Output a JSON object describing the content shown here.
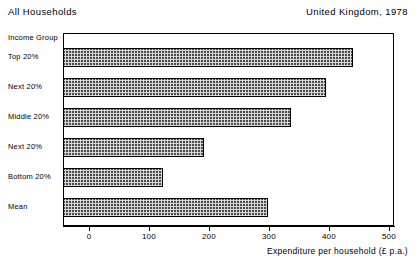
{
  "header": {
    "title": "All Households",
    "subtitle": "United Kingdom, 1978"
  },
  "chart_data": {
    "type": "bar",
    "orientation": "horizontal",
    "title": "All Households",
    "subtitle": "United Kingdom, 1978",
    "category_axis_title": "Income Group",
    "categories": [
      "Top 20%",
      "Next 20%",
      "Middle 20%",
      "Next 20%",
      "Bottom 20%",
      "Mean"
    ],
    "values": [
      440,
      395,
      337,
      192,
      123,
      298
    ],
    "xlabel": "Expenditure per household (£ p.a.)",
    "ylabel": "Income Group",
    "xlim": [
      0,
      500
    ],
    "xticks": [
      0,
      100,
      200,
      300,
      400,
      500
    ],
    "xtick_labels": [
      "0",
      "100",
      "200",
      "300",
      "400",
      "500"
    ],
    "grid": false,
    "legend": null,
    "bar_fill": "cross-hatch",
    "bar_edge_color": "#000000"
  }
}
